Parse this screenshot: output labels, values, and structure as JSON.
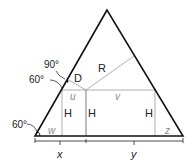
{
  "diagram": {
    "labels": {
      "R": "R",
      "D": "D",
      "u": "u",
      "v": "v",
      "w": "w",
      "z": "z",
      "H_left": "H",
      "H_mid": "H",
      "H_right": "H",
      "x": "x",
      "y": "y"
    },
    "angles": {
      "top_left": "90°",
      "mid_left": "60°",
      "bottom_left": "60°"
    },
    "colors": {
      "outline": "#111111",
      "inner_lines": "#9a9a9a",
      "text": "#222222",
      "italic_text": "#888888"
    }
  }
}
